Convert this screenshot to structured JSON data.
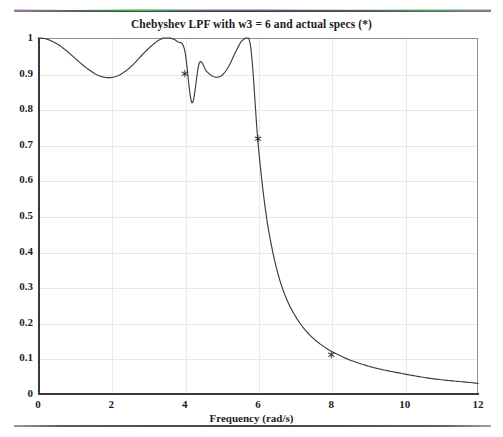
{
  "page": {
    "top_rule": "scan-rule",
    "bottom_rule": "scan-rule"
  },
  "chart_data": {
    "type": "line",
    "title": "Chebyshev LPF  with w3 = 6  and actual specs (*)",
    "xlabel": "Frequency  (rad/s)",
    "ylabel": "",
    "xlim": [
      0,
      12
    ],
    "ylim": [
      0,
      1
    ],
    "xticks": [
      0,
      2,
      4,
      6,
      8,
      10,
      12
    ],
    "xtick_labels": [
      "0",
      "2",
      "4",
      "6",
      "8",
      "10",
      "12"
    ],
    "yticks": [
      0,
      0.1,
      0.2,
      0.3,
      0.4,
      0.5,
      0.6,
      0.7,
      0.8,
      0.9,
      1
    ],
    "ytick_labels": [
      "0",
      "0.1",
      "0.2",
      "0.3",
      "0.4",
      "0.5",
      "0.6",
      "0.7",
      "0.8",
      "0.9",
      "1"
    ],
    "grid": true,
    "legend": "none",
    "line_color": "#3d3d3d",
    "marker_color": "#2a2a2a",
    "series": [
      {
        "name": "Chebyshev magnitude response",
        "x": [
          0.0,
          0.2,
          0.4,
          0.6,
          0.8,
          1.0,
          1.2,
          1.4,
          1.6,
          1.8,
          2.0,
          2.2,
          2.4,
          2.6,
          2.8,
          3.0,
          3.2,
          3.4,
          3.6,
          3.8,
          4.0,
          4.2,
          4.4,
          4.6,
          4.8,
          5.0,
          5.2,
          5.4,
          5.6,
          5.8,
          6.0,
          6.2,
          6.4,
          6.6,
          6.8,
          7.0,
          7.2,
          7.4,
          7.6,
          7.8,
          8.0,
          8.4,
          8.8,
          9.2,
          9.6,
          10.0,
          10.5,
          11.0,
          11.5,
          12.0
        ],
        "y": [
          1.0,
          0.998,
          0.99,
          0.978,
          0.962,
          0.944,
          0.926,
          0.91,
          0.897,
          0.89,
          0.889,
          0.895,
          0.908,
          0.926,
          0.948,
          0.969,
          0.987,
          0.999,
          1.0,
          0.99,
          0.966,
          0.818,
          0.93,
          0.906,
          0.891,
          0.894,
          0.92,
          0.963,
          0.995,
          0.975,
          0.707,
          0.52,
          0.4,
          0.318,
          0.262,
          0.222,
          0.191,
          0.167,
          0.148,
          0.133,
          0.12,
          0.1,
          0.085,
          0.073,
          0.064,
          0.056,
          0.047,
          0.04,
          0.035,
          0.03
        ]
      }
    ],
    "spec_markers": {
      "name": "actual specs",
      "symbol": "*",
      "points": [
        {
          "x": 4.0,
          "y": 0.89
        },
        {
          "x": 6.0,
          "y": 0.707
        },
        {
          "x": 8.0,
          "y": 0.1
        }
      ]
    }
  }
}
